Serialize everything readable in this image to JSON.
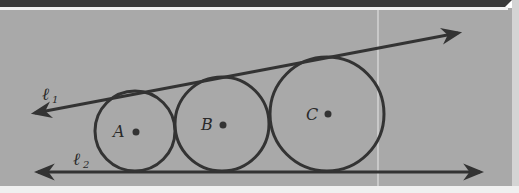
{
  "figure": {
    "background": "#a9a9a9",
    "band_color": "#3a3a3a",
    "ink_color": "#333333",
    "lines": [
      {
        "id": "l1",
        "label": "ℓ",
        "subscript": "1",
        "x1": 35,
        "y1": 113,
        "x2": 458,
        "y2": 33
      },
      {
        "id": "l2",
        "label": "ℓ",
        "subscript": "2",
        "x1": 38,
        "y1": 172,
        "x2": 480,
        "y2": 172
      }
    ],
    "circles": [
      {
        "id": "A",
        "label": "A",
        "cx": 135,
        "cy": 131,
        "r": 40,
        "dot_x": 136,
        "dot_y": 132
      },
      {
        "id": "B",
        "label": "B",
        "cx": 222,
        "cy": 124,
        "r": 47,
        "dot_x": 223,
        "dot_y": 125
      },
      {
        "id": "C",
        "label": "C",
        "cx": 327,
        "cy": 114,
        "r": 57,
        "dot_x": 328,
        "dot_y": 114
      }
    ]
  },
  "labels": {
    "l1": "ℓ",
    "l1_sub": "1",
    "l2": "ℓ",
    "l2_sub": "2",
    "A": "A",
    "B": "B",
    "C": "C"
  }
}
